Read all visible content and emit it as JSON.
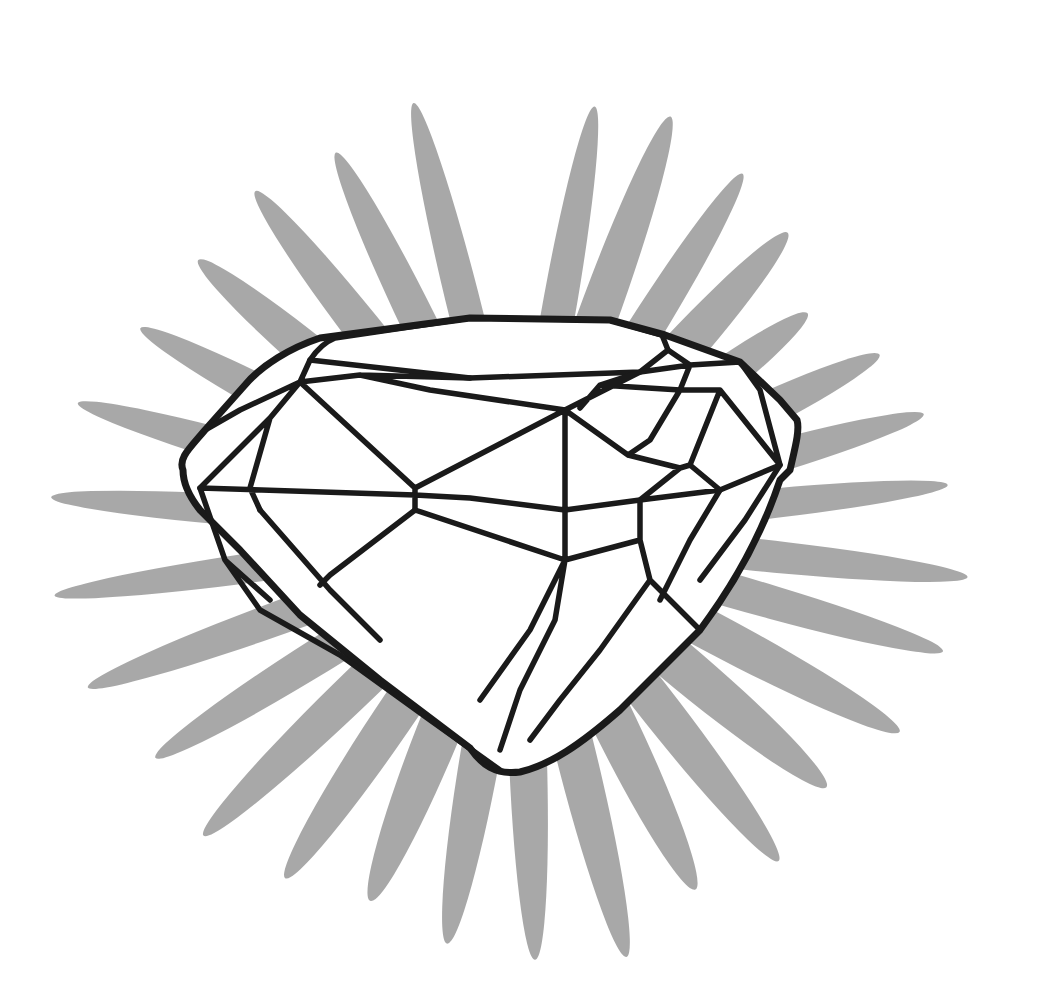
{
  "image": {
    "subject": "diamond",
    "description": "Line drawing of a faceted diamond in front of a gray starburst of elliptical petals",
    "background_color": "#ffffff"
  },
  "colors": {
    "petal": "#a3a3a3",
    "outline": "#1a1a1a",
    "diamond_fill": "#ffffff"
  },
  "starburst": {
    "center": [
      520,
      530
    ],
    "petals": [
      {
        "angle": -80,
        "length": 430,
        "width": 34
      },
      {
        "angle": -70,
        "length": 440,
        "width": 40
      },
      {
        "angle": -58,
        "length": 420,
        "width": 36
      },
      {
        "angle": -48,
        "length": 400,
        "width": 42
      },
      {
        "angle": -37,
        "length": 360,
        "width": 40
      },
      {
        "angle": -26,
        "length": 400,
        "width": 38
      },
      {
        "angle": -16,
        "length": 420,
        "width": 34
      },
      {
        "angle": -6,
        "length": 430,
        "width": 30
      },
      {
        "angle": 6,
        "length": 450,
        "width": 32
      },
      {
        "angle": 16,
        "length": 440,
        "width": 34
      },
      {
        "angle": 28,
        "length": 430,
        "width": 40
      },
      {
        "angle": 40,
        "length": 400,
        "width": 44
      },
      {
        "angle": 52,
        "length": 420,
        "width": 40
      },
      {
        "angle": 64,
        "length": 400,
        "width": 44
      },
      {
        "angle": 76,
        "length": 440,
        "width": 40
      },
      {
        "angle": 88,
        "length": 430,
        "width": 38
      },
      {
        "angle": 100,
        "length": 420,
        "width": 40
      },
      {
        "angle": 112,
        "length": 400,
        "width": 44
      },
      {
        "angle": 124,
        "length": 420,
        "width": 40
      },
      {
        "angle": 136,
        "length": 440,
        "width": 38
      },
      {
        "angle": 148,
        "length": 430,
        "width": 36
      },
      {
        "angle": 160,
        "length": 460,
        "width": 34
      },
      {
        "angle": 172,
        "length": 470,
        "width": 30
      },
      {
        "angle": 184,
        "length": 470,
        "width": 32
      },
      {
        "angle": 196,
        "length": 460,
        "width": 34
      },
      {
        "angle": 208,
        "length": 430,
        "width": 36
      },
      {
        "angle": 220,
        "length": 420,
        "width": 40
      },
      {
        "angle": 232,
        "length": 430,
        "width": 38
      },
      {
        "angle": 244,
        "length": 420,
        "width": 36
      },
      {
        "angle": 256,
        "length": 440,
        "width": 34
      }
    ]
  }
}
